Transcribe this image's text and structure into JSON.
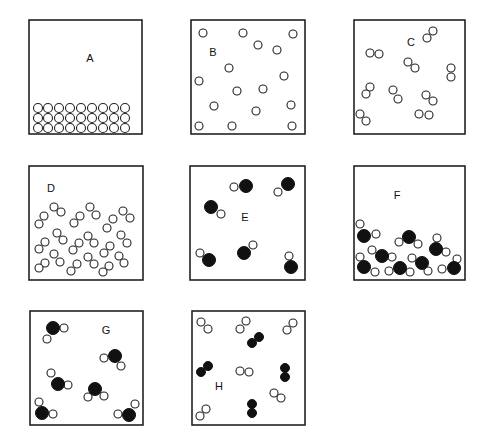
{
  "panels": [
    {
      "id": "A",
      "label": "A",
      "description": "close-packed single atoms (solid)",
      "box": [
        29,
        20,
        113,
        114
      ],
      "label_pos": [
        90,
        62
      ],
      "open_r": 4.5,
      "filled_r": 6,
      "open": [
        [
          38,
          108
        ],
        [
          48,
          108
        ],
        [
          59,
          108
        ],
        [
          70,
          108
        ],
        [
          81,
          108
        ],
        [
          92,
          108
        ],
        [
          103,
          108
        ],
        [
          114,
          108
        ],
        [
          125,
          108
        ],
        [
          38,
          118
        ],
        [
          48,
          118
        ],
        [
          59,
          118
        ],
        [
          70,
          118
        ],
        [
          81,
          118
        ],
        [
          92,
          118
        ],
        [
          103,
          118
        ],
        [
          114,
          118
        ],
        [
          125,
          118
        ],
        [
          38,
          128
        ],
        [
          48,
          128
        ],
        [
          59,
          128
        ],
        [
          70,
          128
        ],
        [
          81,
          128
        ],
        [
          92,
          128
        ],
        [
          103,
          128
        ],
        [
          114,
          128
        ],
        [
          125,
          128
        ]
      ],
      "filled": []
    },
    {
      "id": "B",
      "label": "B",
      "description": "separated single atoms (gas)",
      "box": [
        191,
        20,
        114,
        114
      ],
      "label_pos": [
        213,
        56
      ],
      "open_r": 4,
      "filled_r": 6,
      "open": [
        [
          203,
          33
        ],
        [
          243,
          33
        ],
        [
          293,
          34
        ],
        [
          258,
          45
        ],
        [
          277,
          50
        ],
        [
          229,
          68
        ],
        [
          199,
          81
        ],
        [
          284,
          76
        ],
        [
          237,
          91
        ],
        [
          263,
          89
        ],
        [
          214,
          106
        ],
        [
          256,
          111
        ],
        [
          291,
          105
        ],
        [
          199,
          126
        ],
        [
          232,
          126
        ],
        [
          292,
          126
        ]
      ],
      "filled": []
    },
    {
      "id": "C",
      "label": "C",
      "description": "separated diatomic molecules (gas)",
      "box": [
        354,
        20,
        111,
        114
      ],
      "label_pos": [
        411,
        46
      ],
      "open_r": 4,
      "filled_r": 6,
      "open": [
        [
          433,
          31
        ],
        [
          427,
          38
        ],
        [
          370,
          53
        ],
        [
          379,
          54
        ],
        [
          408,
          62
        ],
        [
          415,
          68
        ],
        [
          451,
          68
        ],
        [
          451,
          77
        ],
        [
          370,
          87
        ],
        [
          366,
          94
        ],
        [
          393,
          90
        ],
        [
          398,
          99
        ],
        [
          426,
          95
        ],
        [
          433,
          101
        ],
        [
          360,
          114
        ],
        [
          366,
          121
        ],
        [
          419,
          114
        ],
        [
          429,
          115
        ]
      ],
      "filled": []
    },
    {
      "id": "D",
      "label": "D",
      "description": "clustered diatomic molecules (liquid)",
      "box": [
        29,
        166,
        114,
        114
      ],
      "label_pos": [
        51,
        192
      ],
      "open_r": 4,
      "filled_r": 6,
      "open": [
        [
          54,
          207
        ],
        [
          61,
          212
        ],
        [
          90,
          207
        ],
        [
          96,
          215
        ],
        [
          123,
          211
        ],
        [
          130,
          218
        ],
        [
          44,
          216
        ],
        [
          39,
          224
        ],
        [
          80,
          216
        ],
        [
          74,
          223
        ],
        [
          113,
          219
        ],
        [
          107,
          228
        ],
        [
          57,
          233
        ],
        [
          63,
          240
        ],
        [
          88,
          236
        ],
        [
          94,
          243
        ],
        [
          121,
          235
        ],
        [
          127,
          243
        ],
        [
          45,
          242
        ],
        [
          39,
          249
        ],
        [
          79,
          243
        ],
        [
          73,
          250
        ],
        [
          110,
          246
        ],
        [
          104,
          253
        ],
        [
          54,
          254
        ],
        [
          60,
          262
        ],
        [
          88,
          257
        ],
        [
          94,
          264
        ],
        [
          119,
          256
        ],
        [
          124,
          263
        ],
        [
          45,
          263
        ],
        [
          39,
          268
        ],
        [
          77,
          264
        ],
        [
          71,
          271
        ],
        [
          109,
          266
        ],
        [
          103,
          272
        ]
      ],
      "filled": []
    },
    {
      "id": "E",
      "label": "E",
      "description": "separated heteronuclear diatomic molecules (gas)",
      "box": [
        190,
        166,
        115,
        114
      ],
      "label_pos": [
        245,
        221
      ],
      "open_r": 4,
      "filled_r": 6.5,
      "open": [
        [
          234,
          187
        ],
        [
          278,
          192
        ],
        [
          221,
          214
        ],
        [
          253,
          245
        ],
        [
          200,
          253
        ],
        [
          289,
          256
        ]
      ],
      "filled": [
        [
          246,
          186
        ],
        [
          288,
          184
        ],
        [
          211,
          207
        ],
        [
          244,
          253
        ],
        [
          209,
          260
        ],
        [
          291,
          267
        ]
      ]
    },
    {
      "id": "F",
      "label": "F",
      "description": "clustered triatomic molecules (liquid)",
      "box": [
        354,
        166,
        111,
        114
      ],
      "label_pos": [
        397,
        199
      ],
      "open_r": 4,
      "filled_r": 6.5,
      "open": [
        [
          360,
          224
        ],
        [
          376,
          234
        ],
        [
          399,
          242
        ],
        [
          418,
          244
        ],
        [
          437,
          238
        ],
        [
          446,
          252
        ],
        [
          372,
          250
        ],
        [
          392,
          257
        ],
        [
          360,
          257
        ],
        [
          375,
          272
        ],
        [
          389,
          271
        ],
        [
          410,
          272
        ],
        [
          412,
          258
        ],
        [
          428,
          271
        ],
        [
          442,
          269
        ],
        [
          457,
          259
        ]
      ],
      "filled": [
        [
          364,
          236
        ],
        [
          409,
          237
        ],
        [
          436,
          249
        ],
        [
          382,
          256
        ],
        [
          364,
          267
        ],
        [
          400,
          268
        ],
        [
          422,
          263
        ],
        [
          454,
          268
        ]
      ]
    },
    {
      "id": "G",
      "label": "G",
      "description": "separated triatomic molecules (gas)",
      "box": [
        30,
        311,
        113,
        114
      ],
      "label_pos": [
        106,
        334
      ],
      "open_r": 4,
      "filled_r": 6.5,
      "open": [
        [
          64,
          328
        ],
        [
          47,
          339
        ],
        [
          104,
          358
        ],
        [
          121,
          366
        ],
        [
          51,
          373
        ],
        [
          68,
          385
        ],
        [
          88,
          397
        ],
        [
          104,
          396
        ],
        [
          39,
          402
        ],
        [
          53,
          414
        ],
        [
          118,
          414
        ],
        [
          135,
          404
        ]
      ],
      "filled": [
        [
          53,
          328
        ],
        [
          115,
          356
        ],
        [
          58,
          384
        ],
        [
          95,
          389
        ],
        [
          42,
          413
        ],
        [
          129,
          415
        ]
      ]
    },
    {
      "id": "H",
      "label": "H",
      "description": "mixture of homonuclear diatomic molecules (gas)",
      "box": [
        192,
        311,
        113,
        114
      ],
      "label_pos": [
        219,
        390
      ],
      "open_r": 4,
      "filled_r": 4.5,
      "open": [
        [
          201,
          322
        ],
        [
          208,
          329
        ],
        [
          246,
          321
        ],
        [
          240,
          329
        ],
        [
          293,
          323
        ],
        [
          287,
          330
        ],
        [
          240,
          371
        ],
        [
          249,
          372
        ],
        [
          274,
          393
        ],
        [
          281,
          398
        ],
        [
          206,
          409
        ],
        [
          200,
          416
        ]
      ],
      "filled": [
        [
          259,
          337
        ],
        [
          252,
          343
        ],
        [
          208,
          366
        ],
        [
          201,
          372
        ],
        [
          285,
          368
        ],
        [
          285,
          377
        ],
        [
          252,
          404
        ],
        [
          252,
          413
        ]
      ]
    }
  ]
}
